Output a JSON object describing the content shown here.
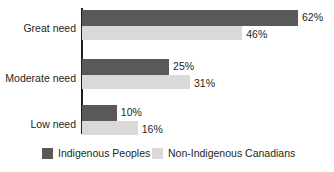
{
  "chart_data": {
    "type": "bar",
    "orientation": "horizontal",
    "title": "",
    "subtitle": "",
    "xlabel": "",
    "ylabel": "",
    "xlim": [
      0,
      70
    ],
    "grid": false,
    "legend_position": "bottom",
    "categories": [
      "Great need",
      "Moderate need",
      "Low need"
    ],
    "series": [
      {
        "name": "Indigenous Peoples",
        "color": "#595959",
        "values": [
          62,
          25,
          10
        ],
        "value_labels": [
          "62%",
          "25%",
          "10%"
        ]
      },
      {
        "name": "Non-Indigenous Canadians",
        "color": "#d9d9d9",
        "values": [
          46,
          31,
          16
        ],
        "value_labels": [
          "46%",
          "31%",
          "16%"
        ]
      }
    ]
  },
  "axis": {
    "category_labels": [
      "Great need",
      "Moderate need",
      "Low need"
    ]
  },
  "legend": {
    "entries": [
      {
        "label": "Indigenous Peoples",
        "color": "#595959"
      },
      {
        "label": "Non-Indigenous Canadians",
        "color": "#d9d9d9"
      }
    ]
  }
}
